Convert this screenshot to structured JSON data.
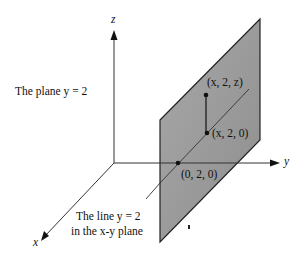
{
  "diagram": {
    "axes": {
      "x": {
        "label": "x"
      },
      "y": {
        "label": "y"
      },
      "z": {
        "label": "z"
      }
    },
    "labels": {
      "plane": "The plane y = 2",
      "line_line1": "The line y = 2",
      "line_line2": "in the x-y plane"
    },
    "points": [
      {
        "id": "p_xyz",
        "label": "(x, 2, z)"
      },
      {
        "id": "p_x20",
        "label": "(x, 2, 0)"
      },
      {
        "id": "p_020",
        "label": "(0, 2, 0)"
      }
    ],
    "colors": {
      "plane_fill": "#9a9a9a",
      "plane_edge": "#222222",
      "axis": "#333333",
      "background": "#ffffff"
    }
  }
}
